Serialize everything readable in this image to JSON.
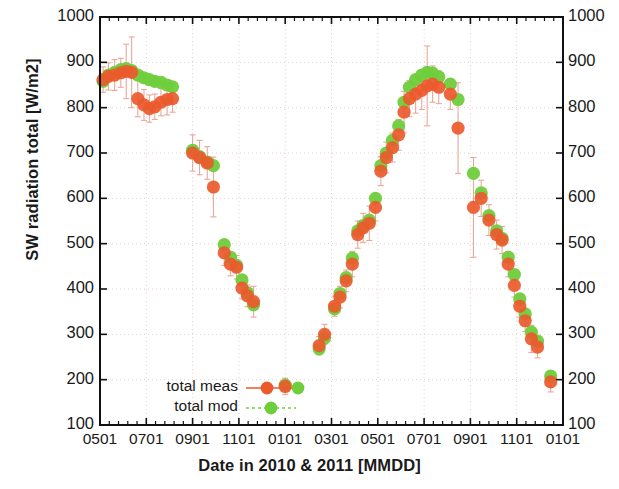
{
  "chart_data": {
    "type": "scatter",
    "title": "",
    "xlabel": "Date in 2010 & 2011 [MMDD]",
    "ylabel": "SW radiation total  [W/m2]",
    "ylim": [
      100,
      1000
    ],
    "yticks": [
      100,
      200,
      300,
      400,
      500,
      600,
      700,
      800,
      900,
      1000
    ],
    "xticks": [
      "0501",
      "0701",
      "0901",
      "1101",
      "0101",
      "0301",
      "0501",
      "0701",
      "0901",
      "1101",
      "0101"
    ],
    "grid": true,
    "legend_position": "bottom-left",
    "y_axis_right_mirrored": true,
    "errorbars": true,
    "series": [
      {
        "name": "total meas",
        "color": "#ea5a2d",
        "marker": "circle",
        "linestyle": "solid",
        "points": [
          {
            "x": "0505",
            "y": 862,
            "err": 28
          },
          {
            "x": "0512",
            "y": 869,
            "err": 30
          },
          {
            "x": "0520",
            "y": 872,
            "err": 34
          },
          {
            "x": "0528",
            "y": 877,
            "err": 32
          },
          {
            "x": "0605",
            "y": 880,
            "err": 60
          },
          {
            "x": "0612",
            "y": 878,
            "err": 78
          },
          {
            "x": "0620",
            "y": 820,
            "err": 40
          },
          {
            "x": "0628",
            "y": 806,
            "err": 34
          },
          {
            "x": "0705",
            "y": 798,
            "err": 30
          },
          {
            "x": "0712",
            "y": 802,
            "err": 28
          },
          {
            "x": "0720",
            "y": 812,
            "err": 30
          },
          {
            "x": "0728",
            "y": 818,
            "err": 34
          },
          {
            "x": "0805",
            "y": 820,
            "err": 30
          },
          {
            "x": "0901",
            "y": 700,
            "err": 40
          },
          {
            "x": "0910",
            "y": 690,
            "err": 38
          },
          {
            "x": "0920",
            "y": 678,
            "err": 36
          },
          {
            "x": "0928",
            "y": 625,
            "err": 66
          },
          {
            "x": "1012",
            "y": 480,
            "err": 28
          },
          {
            "x": "1020",
            "y": 455,
            "err": 26
          },
          {
            "x": "1028",
            "y": 448,
            "err": 26
          },
          {
            "x": "1105",
            "y": 402,
            "err": 24
          },
          {
            "x": "1112",
            "y": 385,
            "err": 24
          },
          {
            "x": "1120",
            "y": 372,
            "err": 34
          },
          {
            "x": "0101",
            "y": 185,
            "err": 18
          },
          {
            "x": "0215",
            "y": 275,
            "err": 20
          },
          {
            "x": "0222",
            "y": 300,
            "err": 22
          },
          {
            "x": "0305",
            "y": 362,
            "err": 22
          },
          {
            "x": "0312",
            "y": 382,
            "err": 24
          },
          {
            "x": "0320",
            "y": 418,
            "err": 24
          },
          {
            "x": "0328",
            "y": 455,
            "err": 28
          },
          {
            "x": "0405",
            "y": 520,
            "err": 30
          },
          {
            "x": "0412",
            "y": 535,
            "err": 32
          },
          {
            "x": "0420",
            "y": 545,
            "err": 38
          },
          {
            "x": "0428",
            "y": 580,
            "err": 30
          },
          {
            "x": "0505",
            "y": 660,
            "err": 32
          },
          {
            "x": "0512",
            "y": 690,
            "err": 34
          },
          {
            "x": "0520",
            "y": 712,
            "err": 32
          },
          {
            "x": "0528",
            "y": 740,
            "err": 34
          },
          {
            "x": "0605",
            "y": 790,
            "err": 46
          },
          {
            "x": "0612",
            "y": 820,
            "err": 40
          },
          {
            "x": "0620",
            "y": 830,
            "err": 42
          },
          {
            "x": "0628",
            "y": 838,
            "err": 42
          },
          {
            "x": "0705",
            "y": 848,
            "err": 88
          },
          {
            "x": "0712",
            "y": 852,
            "err": 40
          },
          {
            "x": "0720",
            "y": 845,
            "err": 36
          },
          {
            "x": "0805",
            "y": 830,
            "err": 34
          },
          {
            "x": "0815",
            "y": 755,
            "err": 100
          },
          {
            "x": "0905",
            "y": 580,
            "err": 110
          },
          {
            "x": "0915",
            "y": 600,
            "err": 40
          },
          {
            "x": "0925",
            "y": 552,
            "err": 34
          },
          {
            "x": "1005",
            "y": 520,
            "err": 32
          },
          {
            "x": "1012",
            "y": 508,
            "err": 30
          },
          {
            "x": "1020",
            "y": 455,
            "err": 28
          },
          {
            "x": "1028",
            "y": 408,
            "err": 26
          },
          {
            "x": "1105",
            "y": 362,
            "err": 24
          },
          {
            "x": "1112",
            "y": 330,
            "err": 24
          },
          {
            "x": "1120",
            "y": 290,
            "err": 30
          },
          {
            "x": "1128",
            "y": 272,
            "err": 24
          },
          {
            "x": "1215",
            "y": 195,
            "err": 22
          }
        ]
      },
      {
        "name": "total mod",
        "color": "#6fce3c",
        "marker": "circle",
        "linestyle": "dotted",
        "points": [
          {
            "x": "0505",
            "y": 858,
            "err": 0
          },
          {
            "x": "0512",
            "y": 872,
            "err": 0
          },
          {
            "x": "0520",
            "y": 878,
            "err": 0
          },
          {
            "x": "0528",
            "y": 884,
            "err": 0
          },
          {
            "x": "0605",
            "y": 886,
            "err": 0
          },
          {
            "x": "0612",
            "y": 882,
            "err": 0
          },
          {
            "x": "0620",
            "y": 872,
            "err": 0
          },
          {
            "x": "0628",
            "y": 866,
            "err": 0
          },
          {
            "x": "0705",
            "y": 862,
            "err": 0
          },
          {
            "x": "0712",
            "y": 858,
            "err": 0
          },
          {
            "x": "0720",
            "y": 856,
            "err": 0
          },
          {
            "x": "0728",
            "y": 850,
            "err": 0
          },
          {
            "x": "0805",
            "y": 846,
            "err": 0
          },
          {
            "x": "0901",
            "y": 706,
            "err": 0
          },
          {
            "x": "0910",
            "y": 692,
            "err": 0
          },
          {
            "x": "0920",
            "y": 680,
            "err": 0
          },
          {
            "x": "0928",
            "y": 672,
            "err": 0
          },
          {
            "x": "1012",
            "y": 498,
            "err": 0
          },
          {
            "x": "1020",
            "y": 470,
            "err": 0
          },
          {
            "x": "1028",
            "y": 452,
            "err": 0
          },
          {
            "x": "1105",
            "y": 420,
            "err": 0
          },
          {
            "x": "1112",
            "y": 392,
            "err": 0
          },
          {
            "x": "1120",
            "y": 365,
            "err": 0
          },
          {
            "x": "0101",
            "y": 188,
            "err": 0
          },
          {
            "x": "0215",
            "y": 268,
            "err": 0
          },
          {
            "x": "0222",
            "y": 292,
            "err": 0
          },
          {
            "x": "0305",
            "y": 356,
            "err": 0
          },
          {
            "x": "0312",
            "y": 390,
            "err": 0
          },
          {
            "x": "0320",
            "y": 425,
            "err": 0
          },
          {
            "x": "0328",
            "y": 468,
            "err": 0
          },
          {
            "x": "0405",
            "y": 528,
            "err": 0
          },
          {
            "x": "0412",
            "y": 540,
            "err": 0
          },
          {
            "x": "0420",
            "y": 552,
            "err": 0
          },
          {
            "x": "0428",
            "y": 600,
            "err": 0
          },
          {
            "x": "0505",
            "y": 672,
            "err": 0
          },
          {
            "x": "0512",
            "y": 700,
            "err": 0
          },
          {
            "x": "0520",
            "y": 728,
            "err": 0
          },
          {
            "x": "0528",
            "y": 760,
            "err": 0
          },
          {
            "x": "0605",
            "y": 812,
            "err": 0
          },
          {
            "x": "0612",
            "y": 845,
            "err": 0
          },
          {
            "x": "0620",
            "y": 862,
            "err": 0
          },
          {
            "x": "0628",
            "y": 872,
            "err": 0
          },
          {
            "x": "0705",
            "y": 878,
            "err": 0
          },
          {
            "x": "0712",
            "y": 876,
            "err": 0
          },
          {
            "x": "0720",
            "y": 868,
            "err": 0
          },
          {
            "x": "0805",
            "y": 852,
            "err": 0
          },
          {
            "x": "0815",
            "y": 818,
            "err": 0
          },
          {
            "x": "0905",
            "y": 655,
            "err": 0
          },
          {
            "x": "0915",
            "y": 612,
            "err": 0
          },
          {
            "x": "0925",
            "y": 562,
            "err": 0
          },
          {
            "x": "1005",
            "y": 528,
            "err": 0
          },
          {
            "x": "1012",
            "y": 512,
            "err": 0
          },
          {
            "x": "1020",
            "y": 470,
            "err": 0
          },
          {
            "x": "1028",
            "y": 432,
            "err": 0
          },
          {
            "x": "1105",
            "y": 378,
            "err": 0
          },
          {
            "x": "1112",
            "y": 345,
            "err": 0
          },
          {
            "x": "1120",
            "y": 305,
            "err": 0
          },
          {
            "x": "1128",
            "y": 285,
            "err": 0
          },
          {
            "x": "1215",
            "y": 208,
            "err": 0
          }
        ]
      }
    ]
  },
  "legend": {
    "entries": [
      {
        "label": "total meas",
        "color": "#ea5a2d",
        "style": "solid"
      },
      {
        "label": "total mod",
        "color": "#6fce3c",
        "style": "dotted"
      }
    ]
  }
}
